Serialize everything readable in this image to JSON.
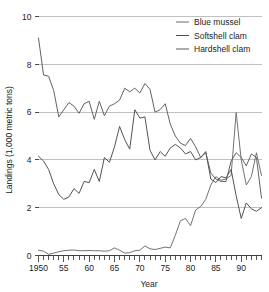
{
  "chart_data": {
    "type": "line",
    "title": "",
    "xlabel": "Year",
    "ylabel": "Landings (1,000 metric tons)",
    "xlim": [
      1950,
      1994
    ],
    "ylim": [
      0,
      10
    ],
    "yticks": [
      0,
      2,
      4,
      6,
      8,
      10
    ],
    "ytick_labels": [
      "0",
      "2",
      "4",
      "6",
      "8",
      "10"
    ],
    "xticks": [
      1950,
      1955,
      1960,
      1965,
      1970,
      1975,
      1980,
      1985,
      1990
    ],
    "xtick_labels": [
      "1950",
      "55",
      "60",
      "65",
      "70",
      "75",
      "80",
      "85",
      "90"
    ],
    "minor_xtick_interval": 1,
    "grid": "horizontal",
    "legend_position": "top-right",
    "x": [
      1950,
      1951,
      1952,
      1953,
      1954,
      1955,
      1956,
      1957,
      1958,
      1959,
      1960,
      1961,
      1962,
      1963,
      1964,
      1965,
      1966,
      1967,
      1968,
      1969,
      1970,
      1971,
      1972,
      1973,
      1974,
      1975,
      1976,
      1977,
      1978,
      1979,
      1980,
      1981,
      1982,
      1983,
      1984,
      1985,
      1986,
      1987,
      1988,
      1989,
      1990,
      1991,
      1992,
      1993,
      1994
    ],
    "series": [
      {
        "name": "Blue mussel",
        "color": "#6b6b6b",
        "values": [
          0.22,
          0.18,
          0.05,
          0.1,
          0.16,
          0.2,
          0.22,
          0.23,
          0.2,
          0.2,
          0.21,
          0.2,
          0.2,
          0.18,
          0.2,
          0.32,
          0.22,
          0.1,
          0.12,
          0.2,
          0.22,
          0.4,
          0.28,
          0.25,
          0.3,
          0.35,
          0.32,
          0.85,
          1.45,
          1.55,
          1.25,
          1.9,
          2.05,
          2.35,
          2.95,
          3.3,
          3.15,
          3.2,
          3.35,
          5.98,
          4.0,
          2.95,
          3.3,
          4.3,
          3.35
        ]
      },
      {
        "name": "Softshell clam",
        "color": "#4a4a4a",
        "values": [
          4.15,
          3.95,
          3.6,
          3.0,
          2.55,
          2.35,
          2.45,
          2.8,
          2.6,
          3.1,
          3.05,
          3.6,
          3.1,
          4.1,
          3.9,
          4.55,
          5.4,
          4.85,
          4.45,
          6.1,
          5.75,
          5.8,
          4.4,
          4.0,
          4.35,
          4.15,
          4.5,
          4.65,
          4.5,
          4.25,
          4.35,
          4.0,
          4.1,
          4.35,
          3.2,
          3.05,
          3.3,
          3.25,
          3.6,
          2.5,
          1.55,
          2.2,
          1.95,
          1.85,
          2.0
        ]
      },
      {
        "name": "Hardshell clam",
        "color": "#5a5a5a",
        "values": [
          9.1,
          7.55,
          7.5,
          6.9,
          5.8,
          6.1,
          6.4,
          6.25,
          5.95,
          6.35,
          6.45,
          5.7,
          6.45,
          5.85,
          6.25,
          6.35,
          6.5,
          7.0,
          6.85,
          7.0,
          6.8,
          7.2,
          6.95,
          6.0,
          6.1,
          6.35,
          5.5,
          5.0,
          4.7,
          4.6,
          4.9,
          4.55,
          4.1,
          4.3,
          3.45,
          3.2,
          3.1,
          3.1,
          3.95,
          4.3,
          4.1,
          3.75,
          4.25,
          4.1,
          2.4
        ]
      }
    ]
  },
  "legend": {
    "items": [
      {
        "label": "Blue mussel"
      },
      {
        "label": "Softshell clam"
      },
      {
        "label": "Hardshell clam"
      }
    ]
  }
}
